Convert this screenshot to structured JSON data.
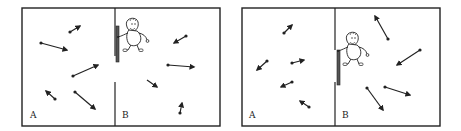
{
  "figure": {
    "ink_color": "#222222",
    "door_color": "#555555",
    "panels": [
      {
        "id": "panel-1",
        "box": {
          "x1": 22,
          "y1": 8,
          "x2": 220,
          "y2": 126
        },
        "divider_x": 115,
        "divider_top_end": 56,
        "divider_bottom_start": 82,
        "door": {
          "x": 116,
          "y": 26,
          "w": 3,
          "h": 36
        },
        "demon": {
          "x": 122,
          "y": 18,
          "facing": "right"
        },
        "labels": [
          {
            "text": "A",
            "x": 30,
            "y": 118
          },
          {
            "text": "B",
            "x": 122,
            "y": 118
          }
        ],
        "molecules": [
          {
            "x1": 70,
            "y1": 32,
            "x2": 80,
            "y2": 26,
            "tail": true
          },
          {
            "x1": 41,
            "y1": 43,
            "x2": 67,
            "y2": 50,
            "tail": true
          },
          {
            "x1": 73,
            "y1": 76,
            "x2": 98,
            "y2": 65,
            "tail": true
          },
          {
            "x1": 55,
            "y1": 99,
            "x2": 46,
            "y2": 91,
            "tail": true
          },
          {
            "x1": 75,
            "y1": 92,
            "x2": 95,
            "y2": 109,
            "tail": true
          },
          {
            "x1": 186,
            "y1": 36,
            "x2": 174,
            "y2": 43,
            "tail": true
          },
          {
            "x1": 168,
            "y1": 65,
            "x2": 194,
            "y2": 67,
            "tail": true
          },
          {
            "x1": 147,
            "y1": 80,
            "x2": 157,
            "y2": 87,
            "tail": false
          },
          {
            "x1": 180,
            "y1": 113,
            "x2": 182,
            "y2": 103,
            "tail": true
          }
        ]
      },
      {
        "id": "panel-2",
        "box": {
          "x1": 242,
          "y1": 8,
          "x2": 440,
          "y2": 126
        },
        "divider_x": 335,
        "divider_top_end": 50,
        "divider_bottom_start": 82,
        "door": {
          "x": 337,
          "y": 50,
          "w": 3,
          "h": 35
        },
        "demon": {
          "x": 342,
          "y": 32,
          "facing": "right"
        },
        "labels": [
          {
            "text": "A",
            "x": 249,
            "y": 118
          },
          {
            "text": "B",
            "x": 342,
            "y": 118
          }
        ],
        "molecules": [
          {
            "x1": 284,
            "y1": 33,
            "x2": 292,
            "y2": 25,
            "tail": true
          },
          {
            "x1": 267,
            "y1": 61,
            "x2": 257,
            "y2": 70,
            "tail": true
          },
          {
            "x1": 292,
            "y1": 63,
            "x2": 304,
            "y2": 60,
            "tail": true
          },
          {
            "x1": 292,
            "y1": 82,
            "x2": 281,
            "y2": 87,
            "tail": true
          },
          {
            "x1": 309,
            "y1": 107,
            "x2": 300,
            "y2": 101,
            "tail": true
          },
          {
            "x1": 388,
            "y1": 39,
            "x2": 375,
            "y2": 16,
            "tail": true
          },
          {
            "x1": 420,
            "y1": 50,
            "x2": 397,
            "y2": 65,
            "tail": true
          },
          {
            "x1": 385,
            "y1": 87,
            "x2": 410,
            "y2": 95,
            "tail": true
          },
          {
            "x1": 367,
            "y1": 88,
            "x2": 383,
            "y2": 110,
            "tail": true
          }
        ]
      }
    ]
  }
}
